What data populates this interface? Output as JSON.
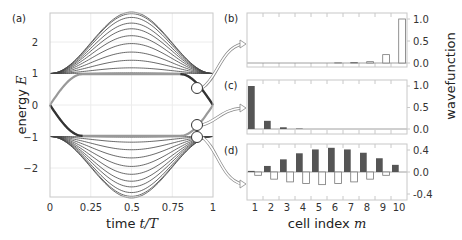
{
  "chart_data": [
    {
      "panel": "(a)",
      "type": "line",
      "title": "",
      "xlabel": "time t/T",
      "ylabel": "energy E",
      "xlim": [
        0,
        1
      ],
      "ylim": [
        -2.95,
        2.95
      ],
      "xticks": [
        "0",
        "0.25",
        "0.5",
        "0.75",
        "1"
      ],
      "yticks": [
        "2",
        "1",
        "0",
        "−1",
        "−2"
      ],
      "grid": true,
      "description": "Energy spectrum vs time; upper band fans from E=1 up to E≈2.95 at t/T=0.5, lower band mirrors down to E≈−2.95; two edge-state branches cross the gap from E=0 at t=0 to E=±1, returning to 0 at t=1",
      "upper_band_peaks": [
        1.02,
        1.18,
        1.42,
        1.68,
        1.95,
        2.2,
        2.42,
        2.6,
        2.78,
        2.9,
        2.95
      ],
      "lower_band_troughs": [
        -1.02,
        -1.18,
        -1.42,
        -1.68,
        -1.95,
        -2.2,
        -2.42,
        -2.6,
        -2.78,
        -2.9,
        -2.95
      ],
      "markers": [
        {
          "t": 0.9,
          "E": 0.5,
          "links_to": "(b)"
        },
        {
          "t": 0.9,
          "E": -0.62,
          "links_to": "(c)"
        },
        {
          "t": 0.9,
          "E": -1.0,
          "links_to": "(d)"
        }
      ]
    },
    {
      "panel": "(b)",
      "type": "bar",
      "categories": [
        "1",
        "2",
        "3",
        "4",
        "5",
        "6",
        "7",
        "8",
        "9",
        "10"
      ],
      "series": [
        {
          "name": "sublattice A",
          "values": [
            0.0,
            0.0,
            0.0,
            0.0,
            0.0,
            0.0,
            0.0,
            0.0,
            0.0,
            0.0
          ]
        },
        {
          "name": "sublattice B",
          "values": [
            0.0,
            0.0,
            0.0,
            0.0,
            0.0,
            0.005,
            0.01,
            0.03,
            0.19,
            1.0
          ]
        }
      ],
      "yticks": [
        "0.0",
        "0.5",
        "1.0"
      ],
      "ylim": [
        -0.1,
        1.1
      ]
    },
    {
      "panel": "(c)",
      "type": "bar",
      "categories": [
        "1",
        "2",
        "3",
        "4",
        "5",
        "6",
        "7",
        "8",
        "9",
        "10"
      ],
      "series": [
        {
          "name": "sublattice A",
          "values": [
            1.0,
            0.19,
            0.04,
            0.01,
            0.0,
            0.0,
            0.0,
            0.0,
            0.0,
            0.0
          ]
        },
        {
          "name": "sublattice B",
          "values": [
            0.0,
            0.0,
            0.0,
            0.0,
            0.0,
            0.0,
            0.0,
            0.0,
            0.0,
            0.0
          ]
        }
      ],
      "yticks": [
        "0.0",
        "0.5",
        "1.0"
      ],
      "ylim": [
        -0.1,
        1.1
      ],
      "ylabel": "wavefunction"
    },
    {
      "panel": "(d)",
      "type": "bar",
      "categories": [
        "1",
        "2",
        "3",
        "4",
        "5",
        "6",
        "7",
        "8",
        "9",
        "10"
      ],
      "series": [
        {
          "name": "sublattice A",
          "values": [
            0.02,
            0.11,
            0.23,
            0.34,
            0.41,
            0.44,
            0.41,
            0.35,
            0.25,
            0.13
          ]
        },
        {
          "name": "sublattice B",
          "values": [
            -0.06,
            -0.13,
            -0.18,
            -0.21,
            -0.23,
            -0.21,
            -0.18,
            -0.13,
            -0.06,
            0.0
          ]
        }
      ],
      "yticks": [
        "0.4",
        "0.0",
        "-0.4"
      ],
      "ylim": [
        -0.55,
        0.55
      ],
      "xlabel": "cell index m"
    }
  ],
  "panel_a": {
    "label": "(a)",
    "xlabel_text": "time ",
    "xlabel_math": "t/T",
    "ylabel_text": "energy ",
    "ylabel_math": "E",
    "xticks": [
      "0",
      "0.25",
      "0.5",
      "0.75",
      "1"
    ],
    "yticks": [
      "2",
      "1",
      "0",
      "−1",
      "−2"
    ]
  },
  "panel_b": {
    "label": "(b)",
    "yticks": [
      "1.0",
      "0.5",
      "0.0"
    ]
  },
  "panel_c": {
    "label": "(c)",
    "yticks": [
      "1.0",
      "0.5",
      "0.0"
    ]
  },
  "panel_d": {
    "label": "(d)",
    "yticks": [
      "0.4",
      "0.0",
      "-0.4"
    ]
  },
  "right_ylabel": "wavefunction",
  "bottom_xlabel_text": "cell index ",
  "bottom_xlabel_math": "m",
  "bar_xticks": [
    "1",
    "2",
    "3",
    "4",
    "5",
    "6",
    "7",
    "8",
    "9",
    "10"
  ],
  "colors": {
    "axis": "#c8c8c8",
    "grid": "#ececec",
    "curve": "#444444",
    "edge_curve": "#555555",
    "bar_filled": "#555555",
    "bar_open_stroke": "#777777"
  }
}
